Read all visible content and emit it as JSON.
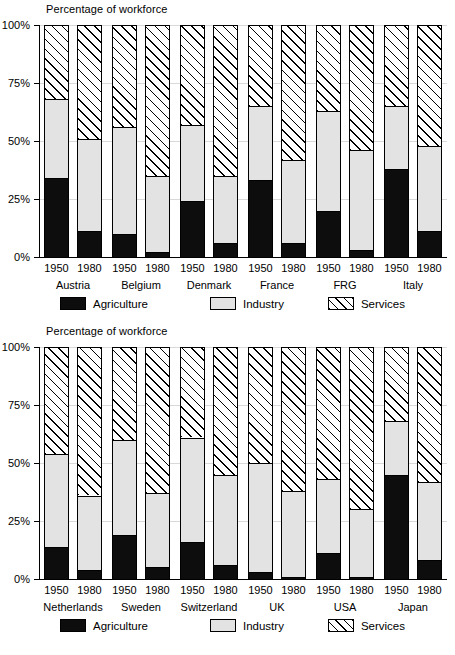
{
  "chart_data": [
    {
      "type": "bar",
      "subtype": "stacked-percentage",
      "title": "Percentage of workforce",
      "xlabel": "",
      "ylabel": "",
      "ylim": [
        0,
        100
      ],
      "ytick_labels": [
        "0%",
        "25%",
        "50%",
        "75%",
        "100%"
      ],
      "ytick_values": [
        0,
        25,
        50,
        75,
        100
      ],
      "grid": true,
      "legend_position": "bottom",
      "legend": [
        "Agriculture",
        "Industry",
        "Services"
      ],
      "categories": [
        "Austria",
        "Belgium",
        "Denmark",
        "France",
        "FRG",
        "Italy"
      ],
      "years": [
        "1950",
        "1980"
      ],
      "bars": [
        {
          "country": "Austria",
          "year": "1950",
          "agriculture": 34,
          "industry": 34,
          "services": 32
        },
        {
          "country": "Austria",
          "year": "1980",
          "agriculture": 11,
          "industry": 40,
          "services": 49
        },
        {
          "country": "Belgium",
          "year": "1950",
          "agriculture": 10,
          "industry": 46,
          "services": 44
        },
        {
          "country": "Belgium",
          "year": "1980",
          "agriculture": 2,
          "industry": 33,
          "services": 65
        },
        {
          "country": "Denmark",
          "year": "1950",
          "agriculture": 24,
          "industry": 33,
          "services": 43
        },
        {
          "country": "Denmark",
          "year": "1980",
          "agriculture": 6,
          "industry": 29,
          "services": 65
        },
        {
          "country": "France",
          "year": "1950",
          "agriculture": 33,
          "industry": 32,
          "services": 35
        },
        {
          "country": "France",
          "year": "1980",
          "agriculture": 6,
          "industry": 36,
          "services": 58
        },
        {
          "country": "FRG",
          "year": "1950",
          "agriculture": 20,
          "industry": 43,
          "services": 37
        },
        {
          "country": "FRG",
          "year": "1980",
          "agriculture": 3,
          "industry": 43,
          "services": 54
        },
        {
          "country": "Italy",
          "year": "1950",
          "agriculture": 38,
          "industry": 27,
          "services": 35
        },
        {
          "country": "Italy",
          "year": "1980",
          "agriculture": 11,
          "industry": 37,
          "services": 52
        }
      ]
    },
    {
      "type": "bar",
      "subtype": "stacked-percentage",
      "title": "Percentage of workforce",
      "xlabel": "",
      "ylabel": "",
      "ylim": [
        0,
        100
      ],
      "ytick_labels": [
        "0%",
        "25%",
        "50%",
        "75%",
        "100%"
      ],
      "ytick_values": [
        0,
        25,
        50,
        75,
        100
      ],
      "grid": true,
      "legend_position": "bottom",
      "legend": [
        "Agriculture",
        "Industry",
        "Services"
      ],
      "categories": [
        "Netherlands",
        "Sweden",
        "Switzerland",
        "UK",
        "USA",
        "Japan"
      ],
      "years": [
        "1950",
        "1980"
      ],
      "bars": [
        {
          "country": "Netherlands",
          "year": "1950",
          "agriculture": 14,
          "industry": 40,
          "services": 46
        },
        {
          "country": "Netherlands",
          "year": "1980",
          "agriculture": 4,
          "industry": 32,
          "services": 64
        },
        {
          "country": "Sweden",
          "year": "1950",
          "agriculture": 19,
          "industry": 41,
          "services": 40
        },
        {
          "country": "Sweden",
          "year": "1980",
          "agriculture": 5,
          "industry": 32,
          "services": 63
        },
        {
          "country": "Switzerland",
          "year": "1950",
          "agriculture": 16,
          "industry": 45,
          "services": 39
        },
        {
          "country": "Switzerland",
          "year": "1980",
          "agriculture": 6,
          "industry": 39,
          "services": 55
        },
        {
          "country": "UK",
          "year": "1950",
          "agriculture": 3,
          "industry": 47,
          "services": 50
        },
        {
          "country": "UK",
          "year": "1980",
          "agriculture": 1,
          "industry": 37,
          "services": 62
        },
        {
          "country": "USA",
          "year": "1950",
          "agriculture": 11,
          "industry": 32,
          "services": 57
        },
        {
          "country": "USA",
          "year": "1980",
          "agriculture": 1,
          "industry": 29,
          "services": 70
        },
        {
          "country": "Japan",
          "year": "1950",
          "agriculture": 45,
          "industry": 23,
          "services": 32
        },
        {
          "country": "Japan",
          "year": "1980",
          "agriculture": 8,
          "industry": 34,
          "services": 58
        }
      ]
    }
  ],
  "colors": {
    "agriculture": "#0d0d0d",
    "industry": "#e3e3e3",
    "services": "#ffffff",
    "axis": "#000000",
    "grid": "#d9d9d9"
  }
}
